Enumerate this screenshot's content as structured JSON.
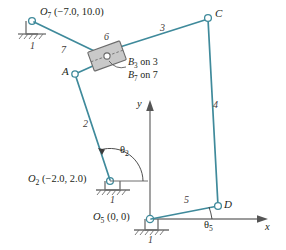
{
  "figure": {
    "colors": {
      "link": "#3f8a9b",
      "ground": "#6e6e6e",
      "axis": "#7a7a7a",
      "text": "#231f20",
      "slider_fill": "#c9c9c9",
      "slider_stroke": "#6b6b6b",
      "joint_fill": "#ffffff"
    },
    "joints": [
      {
        "name": "O7",
        "label": "O",
        "sub": "7",
        "coord": "(−7.0, 10.0)",
        "x": 32,
        "y": 21,
        "type": "ground-pivot"
      },
      {
        "name": "A",
        "label": "A",
        "sub": "",
        "coord": "",
        "x": 75,
        "y": 74,
        "type": "pin"
      },
      {
        "name": "B",
        "label": "B",
        "sub": "",
        "coord": "",
        "x": 107,
        "y": 56,
        "type": "slider"
      },
      {
        "name": "C",
        "label": "C",
        "sub": "",
        "coord": "",
        "x": 208,
        "y": 18,
        "type": "pin"
      },
      {
        "name": "D",
        "label": "D",
        "sub": "",
        "coord": "",
        "x": 218,
        "y": 206,
        "type": "pin"
      },
      {
        "name": "O2",
        "label": "O",
        "sub": "2",
        "coord": "(−2.0, 2.0)",
        "x": 110,
        "y": 181,
        "type": "ground-pivot"
      },
      {
        "name": "O5",
        "label": "O",
        "sub": "5",
        "coord": "(0, 0)",
        "x": 150,
        "y": 219,
        "type": "ground-pivot"
      }
    ],
    "links": [
      {
        "number": "7",
        "label_x": 61,
        "label_y": 45,
        "from": "O7",
        "to": "B"
      },
      {
        "number": "6",
        "label_x": 104,
        "label_y": 36,
        "from": "B",
        "to": "B",
        "note": "slider block"
      },
      {
        "number": "3",
        "label_x": 160,
        "label_y": 27,
        "from": "B",
        "to": "C"
      },
      {
        "number": "4",
        "label_x": 213,
        "label_y": 104,
        "from": "C",
        "to": "D"
      },
      {
        "number": "2",
        "label_x": 83,
        "label_y": 123,
        "from": "O2",
        "to": "A"
      },
      {
        "number": "5",
        "label_x": 184,
        "label_y": 199,
        "from": "O5",
        "to": "D"
      }
    ],
    "ground_labels": [
      {
        "text": "1",
        "x": 35,
        "y": 43
      },
      {
        "text": "1",
        "x": 113,
        "y": 197
      },
      {
        "text": "1",
        "x": 150,
        "y": 239
      }
    ],
    "slider_annotations": [
      {
        "text": "B",
        "sub": "3",
        "rest": " on 3",
        "x": 129,
        "y": 62
      },
      {
        "text": "B",
        "sub": "7",
        "rest": " on 7",
        "x": 129,
        "y": 74
      }
    ],
    "angles": [
      {
        "name": "theta2",
        "glyph": "θ",
        "sub": "2",
        "label_x": 124,
        "label_y": 151,
        "vertex": "O2"
      },
      {
        "name": "theta5",
        "glyph": "θ",
        "sub": "5",
        "label_x": 208,
        "label_y": 225,
        "vertex": "O5"
      }
    ],
    "axes": {
      "origin": {
        "x": 150,
        "y": 219
      },
      "x_label": "x",
      "x_label_pos": {
        "x": 266,
        "y": 225
      },
      "y_label": "y",
      "y_label_pos": {
        "x": 138,
        "y": 103
      }
    }
  }
}
